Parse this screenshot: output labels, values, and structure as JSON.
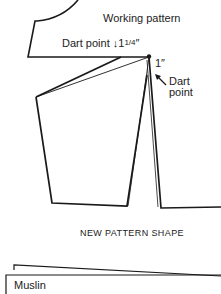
{
  "labels": {
    "working_pattern": "Working pattern",
    "dart_point_top": "Dart point",
    "dart_arrow": "↓",
    "dart_measure_whole": "1",
    "dart_measure_fraction": "1/4",
    "dart_measure_unit": "″",
    "one_inch": "1″",
    "dart_point_right_line1": "Dart",
    "dart_point_right_line2": "point",
    "new_pattern_shape": "NEW PATTERN SHAPE",
    "muslin": "Muslin"
  },
  "colors": {
    "line": "#1a1a1a",
    "background": "#ffffff"
  }
}
